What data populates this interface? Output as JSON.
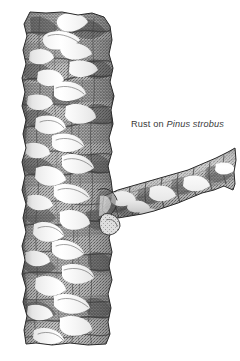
{
  "figure": {
    "kind": "botanical-illustration",
    "condition": "white pine blister rust",
    "background_color": "#ffffff",
    "ink_color": "#2b2b2b",
    "bark_midtone_color": "#9a9a9a",
    "bark_shadow_color": "#4a4a4a",
    "blister_highlight_color": "#ffffff",
    "trunk": {
      "label": "vertical trunk with rough fissured bark",
      "left_px": 22,
      "right_px": 114,
      "top_px": 12,
      "bottom_px": 345
    },
    "branch": {
      "label": "lateral branch angled upward to the right",
      "origin_px": [
        104,
        200
      ],
      "tip_px": [
        235,
        168
      ],
      "top_px": 148,
      "bottom_px": 218
    },
    "lesions_label": "pale cankered blister areas on bark"
  },
  "caption": {
    "prefix": "Rust on ",
    "species": "Pinus strobus",
    "full_text": "Rust on Pinus strobus",
    "color": "#3a3a3a"
  }
}
